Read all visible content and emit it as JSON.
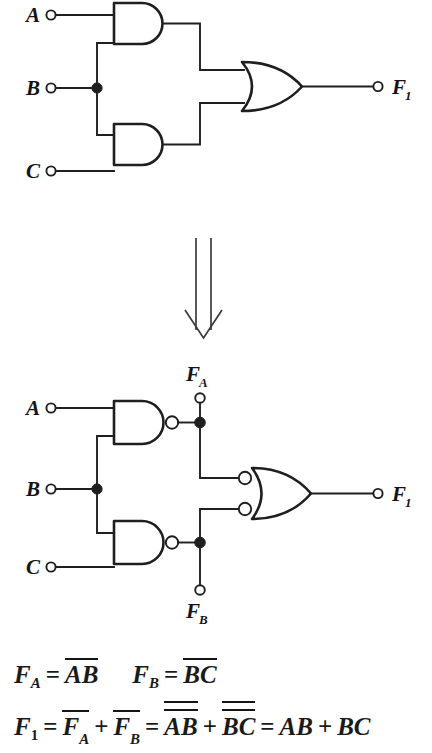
{
  "figure": {
    "title_hidden": "",
    "circuit_top": {
      "name": "AND-AND-OR implementation",
      "inputs": [
        {
          "label": "A",
          "sub": "",
          "x": 26,
          "y": 22
        },
        {
          "label": "B",
          "sub": "",
          "x": 26,
          "y": 95
        },
        {
          "label": "C",
          "sub": "",
          "x": 26,
          "y": 178
        }
      ],
      "output": {
        "label": "F",
        "sub": "1",
        "x": 392,
        "y": 94
      },
      "gates": [
        {
          "type": "and",
          "name": "and-gate-ab"
        },
        {
          "type": "and",
          "name": "and-gate-bc"
        },
        {
          "type": "or",
          "name": "or-gate-f1"
        }
      ]
    },
    "arrow": {
      "name": "transform-arrow-down",
      "glyph": "double-line-down-arrow"
    },
    "circuit_bottom": {
      "name": "NAND-NAND-NOR implementation",
      "inputs": [
        {
          "label": "A",
          "sub": "",
          "x": 26,
          "y": 415
        },
        {
          "label": "B",
          "sub": "",
          "x": 26,
          "y": 496
        },
        {
          "label": "C",
          "sub": "",
          "x": 26,
          "y": 574
        }
      ],
      "taps": [
        {
          "label": "F",
          "sub": "A",
          "x": 189,
          "y": 381
        },
        {
          "label": "F",
          "sub": "B",
          "x": 189,
          "y": 618
        }
      ],
      "output": {
        "label": "F",
        "sub": "1",
        "x": 392,
        "y": 500
      },
      "gates": [
        {
          "type": "nand",
          "name": "nand-gate-ab"
        },
        {
          "type": "nand",
          "name": "nand-gate-bc"
        },
        {
          "type": "nor",
          "name": "nor-gate-f1"
        }
      ]
    }
  },
  "equations": {
    "row1": {
      "eq_fa": {
        "lhs_var": "F",
        "lhs_sub": "A",
        "equals": "=",
        "bar_term": "AB"
      },
      "eq_fb": {
        "lhs_var": "F",
        "lhs_sub": "B",
        "equals": "=",
        "bar_term": "BC"
      }
    },
    "row2": {
      "lhs_var": "F",
      "lhs_sub": "1",
      "equals_1": "=",
      "term_a_var": "F",
      "term_a_sub": "A",
      "plus_1": "+",
      "term_b_var": "F",
      "term_b_sub": "B",
      "equals_2": "=",
      "dbl_term_1": "AB",
      "plus_2": "+",
      "dbl_term_2": "BC",
      "equals_3": "=",
      "final_1": "AB",
      "final_plus": "+",
      "final_2": "BC"
    }
  },
  "colors": {
    "ink": "#1f1f1f",
    "paper": "#ffffff",
    "arrow": "#3a3a3a"
  }
}
